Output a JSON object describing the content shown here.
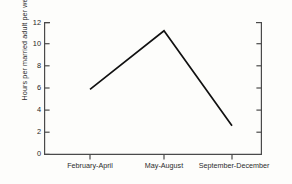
{
  "chart_data": {
    "type": "line",
    "title": "",
    "subtitle": "",
    "xlabel": "",
    "ylabel": "Hours per married adult per week",
    "categories": [
      "February-April",
      "May-August",
      "September-December"
    ],
    "values": [
      5.9,
      11.2,
      2.6
    ],
    "series": [
      {
        "name": "Hours per married adult per week",
        "values": [
          5.9,
          11.2,
          2.6
        ]
      }
    ],
    "ylim": [
      0,
      12
    ],
    "ytick_labels": [
      "0",
      "2",
      "4",
      "6",
      "8",
      "10",
      "12"
    ],
    "ytick_values": [
      0,
      2,
      4,
      6,
      8,
      10,
      12
    ],
    "grid": false,
    "legend": false,
    "legend_position": "none",
    "line_color": "#111111",
    "markers": false,
    "axis_color": "#4a4a4a",
    "background_color": "#fdfdfb"
  }
}
